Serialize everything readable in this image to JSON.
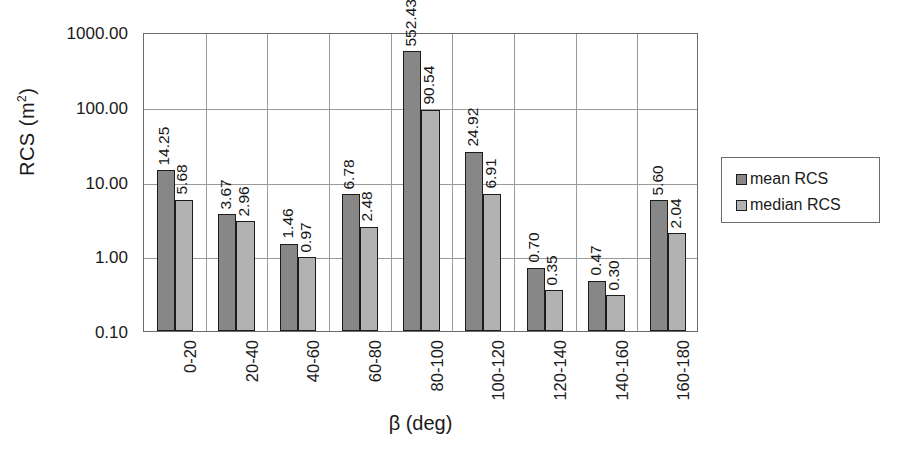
{
  "chart_data": {
    "type": "bar",
    "title": "",
    "subtitle": "",
    "xlabel": "β (deg)",
    "ylabel": "RCS (m²)",
    "ylabel_base": "RCS (m",
    "ylabel_sup": "2",
    "ylabel_tail": ")",
    "yscale": "log",
    "ylim": [
      0.1,
      1000.0
    ],
    "grid": "horizontal-and-category-separators",
    "legend_position": "right",
    "categories": [
      "0-20",
      "20-40",
      "40-60",
      "60-80",
      "80-100",
      "100-120",
      "120-140",
      "140-160",
      "160-180"
    ],
    "ytick_labels": [
      "1000.00",
      "100.00",
      "10.00",
      "1.00",
      "0.10"
    ],
    "ytick_values": [
      1000.0,
      100.0,
      10.0,
      1.0,
      0.1
    ],
    "series": [
      {
        "name": "mean RCS",
        "color": "#878787",
        "values": [
          14.25,
          3.67,
          1.46,
          6.78,
          552.43,
          24.92,
          0.7,
          0.47,
          5.6
        ],
        "labels": [
          "14.25",
          "3.67",
          "1.46",
          "6.78",
          "552.43",
          "24.92",
          "0.70",
          "0.47",
          "5.60"
        ]
      },
      {
        "name": "median RCS",
        "color": "#b2b2b2",
        "values": [
          5.68,
          2.96,
          0.97,
          2.48,
          90.54,
          6.91,
          0.35,
          0.3,
          2.04
        ],
        "labels": [
          "5.68",
          "2.96",
          "0.97",
          "2.48",
          "90.54",
          "6.91",
          "0.35",
          "0.30",
          "2.04"
        ]
      }
    ]
  },
  "legend": {
    "items": [
      {
        "label": "mean RCS",
        "color": "#878787"
      },
      {
        "label": "median RCS",
        "color": "#b2b2b2"
      }
    ]
  },
  "axes": {
    "x_title": "β (deg)",
    "y_title": "RCS (m2)"
  }
}
